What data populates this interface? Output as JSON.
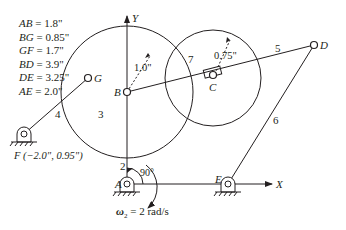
{
  "dimensions": [
    {
      "key": "AB",
      "value": "= 1.8\""
    },
    {
      "key": "BG",
      "value": "= 0.85\""
    },
    {
      "key": "GF",
      "value": "= 1.7\""
    },
    {
      "key": "BD",
      "value": "= 3.9\""
    },
    {
      "key": "DE",
      "value": "= 3.25\""
    },
    {
      "key": "AE",
      "value": "= 2.0\""
    }
  ],
  "points": {
    "A": "A",
    "B": "B",
    "C": "C",
    "D": "D",
    "E": "E",
    "G": "G",
    "F": "F (−2.0\", 0.95\")"
  },
  "links": {
    "l2": "2",
    "l3": "3",
    "l4": "4",
    "l5": "5",
    "l6": "6",
    "l7": "7"
  },
  "axes": {
    "x": "X",
    "y": "Y"
  },
  "radii": {
    "big": "1.0\"",
    "small": "0.75\""
  },
  "angle": "90°",
  "omega": {
    "symbol": "ω",
    "sub": "2",
    "value": " = 2 rad/s"
  },
  "colors": {
    "ink": "#231f20",
    "background": "#ffffff"
  }
}
